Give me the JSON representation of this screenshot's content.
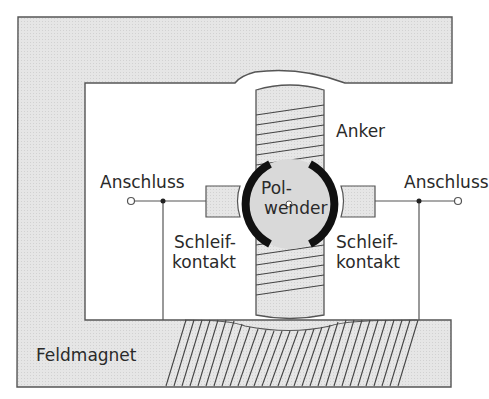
{
  "labels": {
    "anker": "Anker",
    "anschluss_left": "Anschluss",
    "anschluss_right": "Anschluss",
    "polwender_line1": "Pol-",
    "polwender_line2": "wender",
    "schleifkontakt_left_line1": "Schleif-",
    "schleifkontakt_left_line2": "kontakt",
    "schleifkontakt_right_line1": "Schleif-",
    "schleifkontakt_right_line2": "kontakt",
    "feldmagnet": "Feldmagnet"
  },
  "colors": {
    "fill_gray": "#e3e3e3",
    "stroke": "#555555",
    "commutator_black": "#111111",
    "text": "#2a2a2a"
  }
}
